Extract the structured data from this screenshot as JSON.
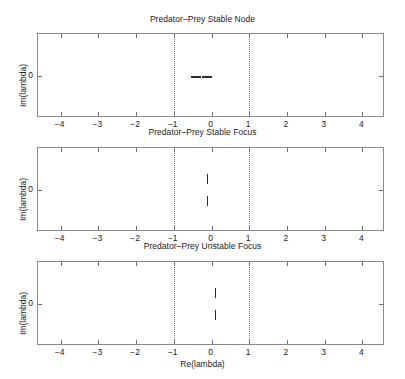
{
  "figure": {
    "xlabel": "Re(lambda)",
    "ylabel": "Im(lambda)",
    "xticks": [
      "-4",
      "-3",
      "-2",
      "-1",
      "0",
      "1",
      "2",
      "3",
      "4"
    ],
    "yticks": [
      "0"
    ],
    "unit_circle_lines": [
      "-1",
      "1"
    ],
    "marker_color": "#2b2b2b",
    "axis_color": "#8a8a8a",
    "dotted_line_color": "#7a7a7a",
    "background": "#ffffff"
  },
  "panels": [
    {
      "title": "Predator–Prey Stable Node",
      "ylabel": "Im(lambda)",
      "ytick_zero": "0",
      "xticklabels": [
        "-4",
        "-3",
        "-2",
        "-1",
        "0",
        "1",
        "2",
        "3",
        "4"
      ]
    },
    {
      "title": "Predator–Prey Stable Focus",
      "ylabel": "Im(lambda)",
      "ytick_zero": "0",
      "xticklabels": [
        "-4",
        "-3",
        "-2",
        "-1",
        "0",
        "1",
        "2",
        "3",
        "4"
      ]
    },
    {
      "title": "Predator–Prey Unstable Focus",
      "ylabel": "Im(lambda)",
      "ytick_zero": "0",
      "xticklabels": [
        "-4",
        "-3",
        "-2",
        "-1",
        "0",
        "1",
        "2",
        "3",
        "4"
      ]
    }
  ],
  "chart_data": [
    {
      "type": "scatter",
      "title": "Predator–Prey Stable Node",
      "xlabel": "",
      "ylabel": "Im(lambda)",
      "xlim": [
        -4.6,
        4.6
      ],
      "ylim": [
        -1.1,
        1.1
      ],
      "xticks": [
        -4,
        -3,
        -2,
        -1,
        0,
        1,
        2,
        3,
        4
      ],
      "yticks": [
        0
      ],
      "grid": false,
      "legend": "none",
      "annotations": [
        {
          "type": "vline",
          "x": -1,
          "style": "dotted"
        },
        {
          "type": "vline",
          "x": 1,
          "style": "dotted"
        }
      ],
      "series": [
        {
          "name": "eigenvalues",
          "marker": "x",
          "x": [
            -0.42,
            -0.12
          ],
          "y": [
            0.0,
            0.0
          ]
        }
      ]
    },
    {
      "type": "scatter",
      "title": "Predator–Prey Stable Focus",
      "xlabel": "",
      "ylabel": "Im(lambda)",
      "xlim": [
        -4.6,
        4.6
      ],
      "ylim": [
        -1.1,
        1.1
      ],
      "xticks": [
        -4,
        -3,
        -2,
        -1,
        0,
        1,
        2,
        3,
        4
      ],
      "yticks": [
        0
      ],
      "grid": false,
      "legend": "none",
      "annotations": [
        {
          "type": "vline",
          "x": -1,
          "style": "dotted"
        },
        {
          "type": "vline",
          "x": 1,
          "style": "dotted"
        }
      ],
      "series": [
        {
          "name": "eigenvalues",
          "marker": "x",
          "x": [
            -0.12,
            -0.12
          ],
          "y": [
            0.28,
            -0.28
          ]
        }
      ]
    },
    {
      "type": "scatter",
      "title": "Predator–Prey Unstable Focus",
      "xlabel": "Re(lambda)",
      "ylabel": "Im(lambda)",
      "xlim": [
        -4.6,
        4.6
      ],
      "ylim": [
        -1.1,
        1.1
      ],
      "xticks": [
        -4,
        -3,
        -2,
        -1,
        0,
        1,
        2,
        3,
        4
      ],
      "yticks": [
        0
      ],
      "grid": false,
      "legend": "none",
      "annotations": [
        {
          "type": "vline",
          "x": -1,
          "style": "dotted"
        },
        {
          "type": "vline",
          "x": 1,
          "style": "dotted"
        }
      ],
      "series": [
        {
          "name": "eigenvalues",
          "marker": "x",
          "x": [
            0.1,
            0.1
          ],
          "y": [
            0.3,
            -0.3
          ]
        }
      ]
    }
  ]
}
